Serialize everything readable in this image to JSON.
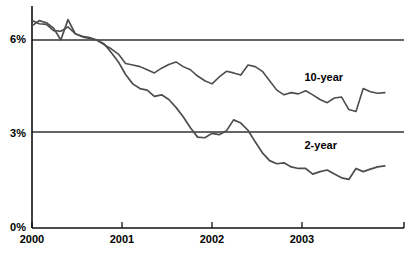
{
  "chart_data": {
    "type": "line",
    "title": "",
    "subtitle": "",
    "xlabel": "",
    "ylabel": "",
    "xlim": [
      2000.0,
      2003.92
    ],
    "ylim": [
      0,
      7.2
    ],
    "yticks": [
      0,
      3,
      6
    ],
    "ytick_labels": [
      "0%",
      "3%",
      "6%"
    ],
    "xticks": [
      2000,
      2001,
      2002,
      2003
    ],
    "xtick_labels": [
      "2000",
      "2001",
      "2002",
      "2003"
    ],
    "grid": "horizontal-at-yticks",
    "legend": "inline-annotations",
    "line_color": "#4d4d4d",
    "axis_color": "#1a1a1a",
    "background": "#ffffff",
    "series": [
      {
        "name": "10-year",
        "label": "10-year",
        "label_x": 2003.05,
        "label_y": 4.78,
        "color": "#4d4d4d",
        "x": [
          2000.0,
          2000.08,
          2000.16,
          2000.24,
          2000.32,
          2000.4,
          2000.48,
          2000.56,
          2000.64,
          2000.72,
          2000.8,
          2000.88,
          2000.96,
          2001.04,
          2001.12,
          2001.2,
          2001.28,
          2001.36,
          2001.44,
          2001.52,
          2001.6,
          2001.68,
          2001.76,
          2001.84,
          2001.92,
          2002.0,
          2002.08,
          2002.16,
          2002.24,
          2002.32,
          2002.4,
          2002.48,
          2002.56,
          2002.64,
          2002.72,
          2002.8,
          2002.88,
          2002.96,
          2003.04,
          2003.12,
          2003.2,
          2003.28,
          2003.36,
          2003.44,
          2003.52,
          2003.6,
          2003.68,
          2003.76,
          2003.84,
          2003.92
        ],
        "values": [
          6.62,
          6.52,
          6.5,
          6.3,
          6.28,
          6.42,
          6.2,
          6.1,
          6.05,
          6.0,
          5.85,
          5.72,
          5.55,
          5.25,
          5.2,
          5.15,
          5.05,
          4.95,
          5.1,
          5.22,
          5.3,
          5.15,
          5.05,
          4.85,
          4.7,
          4.6,
          4.82,
          5.0,
          4.95,
          4.88,
          5.2,
          5.15,
          5.0,
          4.7,
          4.4,
          4.25,
          4.32,
          4.28,
          4.38,
          4.25,
          4.1,
          4.0,
          4.15,
          4.18,
          3.78,
          3.72,
          4.45,
          4.35,
          4.3,
          4.32
        ]
      },
      {
        "name": "2-year",
        "label": "2-year",
        "label_x": 2003.05,
        "label_y": 2.62,
        "color": "#4d4d4d",
        "x": [
          2000.0,
          2000.08,
          2000.16,
          2000.24,
          2000.32,
          2000.4,
          2000.48,
          2000.56,
          2000.64,
          2000.72,
          2000.8,
          2000.88,
          2000.96,
          2001.04,
          2001.12,
          2001.2,
          2001.28,
          2001.36,
          2001.44,
          2001.52,
          2001.6,
          2001.68,
          2001.76,
          2001.84,
          2001.92,
          2002.0,
          2002.08,
          2002.16,
          2002.24,
          2002.32,
          2002.4,
          2002.48,
          2002.56,
          2002.64,
          2002.72,
          2002.8,
          2002.88,
          2002.96,
          2003.04,
          2003.12,
          2003.2,
          2003.28,
          2003.36,
          2003.44,
          2003.52,
          2003.6,
          2003.68,
          2003.76,
          2003.84,
          2003.92
        ],
        "values": [
          6.45,
          6.62,
          6.55,
          6.38,
          6.0,
          6.65,
          6.2,
          6.12,
          6.08,
          6.0,
          5.88,
          5.6,
          5.3,
          4.9,
          4.6,
          4.45,
          4.4,
          4.2,
          4.25,
          4.1,
          3.85,
          3.55,
          3.2,
          2.9,
          2.88,
          3.02,
          2.98,
          3.1,
          3.45,
          3.35,
          3.12,
          2.75,
          2.4,
          2.15,
          2.05,
          2.08,
          1.95,
          1.9,
          1.9,
          1.72,
          1.8,
          1.85,
          1.72,
          1.6,
          1.55,
          1.9,
          1.8,
          1.88,
          1.95,
          1.98
        ]
      }
    ]
  },
  "axes": {
    "y_tick_0": "0%",
    "y_tick_1": "3%",
    "y_tick_2": "6%",
    "x_tick_0": "2000",
    "x_tick_1": "2001",
    "x_tick_2": "2002",
    "x_tick_3": "2003"
  },
  "annotations": {
    "series_10y_label": "10-year",
    "series_2y_label": "2-year"
  }
}
